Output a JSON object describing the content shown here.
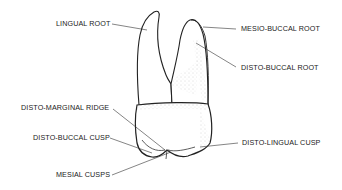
{
  "diagram": {
    "labels": {
      "lingual_root": "LINGUAL ROOT",
      "mesio_buccal_root": "MESIO-BUCCAL ROOT",
      "disto_buccal_root": "DISTO-BUCCAL ROOT",
      "disto_marginal_ridge": "DISTO-MARGINAL RIDGE",
      "disto_buccal_cusp": "DISTO-BUCCAL CUSP",
      "disto_lingual_cusp": "DISTO-LINGUAL CUSP",
      "mesial_cusps": "MESIAL CUSPS"
    }
  }
}
